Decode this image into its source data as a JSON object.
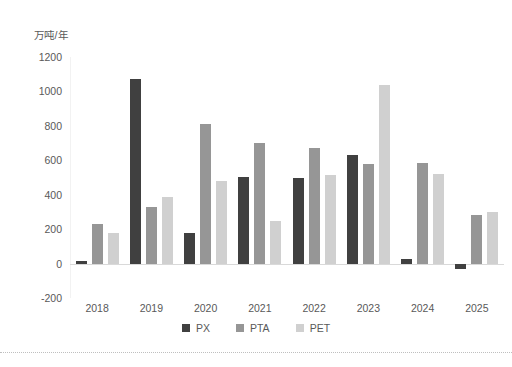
{
  "chart_data": {
    "type": "bar",
    "title": "",
    "subtitle": "",
    "xlabel": "",
    "ylabel": "万吨/年",
    "categories": [
      "2018",
      "2019",
      "2020",
      "2021",
      "2022",
      "2023",
      "2024",
      "2025"
    ],
    "series": [
      {
        "name": "PX",
        "color": "#404040",
        "values": [
          15,
          1075,
          180,
          505,
          495,
          630,
          25,
          -30
        ]
      },
      {
        "name": "PTA",
        "color": "#969696",
        "values": [
          230,
          330,
          810,
          700,
          670,
          580,
          585,
          280
        ]
      },
      {
        "name": "PET",
        "color": "#d0d0d0",
        "values": [
          180,
          385,
          480,
          245,
          515,
          1035,
          520,
          300
        ]
      }
    ],
    "ylim": [
      -200,
      1200
    ],
    "ytick_step": 200,
    "yticks": [
      "1200",
      "1000",
      "800",
      "600",
      "400",
      "200",
      "0",
      "-200"
    ],
    "grid": false,
    "legend_position": "bottom"
  },
  "legend": {
    "items": [
      {
        "label": "PX",
        "color": "#404040"
      },
      {
        "label": "PTA",
        "color": "#969696"
      },
      {
        "label": "PET",
        "color": "#d0d0d0"
      }
    ]
  },
  "colors": {
    "px": "#404040",
    "pta": "#969696",
    "pet": "#d0d0d0",
    "axis": "#d9d9d9",
    "text": "#595959",
    "background": "#ffffff"
  }
}
